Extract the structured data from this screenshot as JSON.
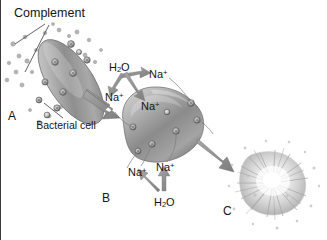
{
  "figure": {
    "background_color": "#ffffff",
    "text_color": "#141414",
    "arrow_color": "#8f8f8f",
    "cell_color": "#9a9a9a"
  },
  "labels": {
    "complement": "Complement",
    "bacterial_cell": "Bacterial cell",
    "panel_a": "A",
    "panel_b": "B",
    "panel_c": "C"
  },
  "ions": {
    "water": "H",
    "water_sub": "2",
    "water_suffix": "O",
    "sodium": "Na",
    "sodium_charge": "+"
  },
  "annotations": [
    {
      "name": "h2o-top",
      "text": "H2O",
      "x": 108,
      "y": 61
    },
    {
      "name": "na-top-right",
      "text": "Na+",
      "x": 148,
      "y": 68
    },
    {
      "name": "na-left",
      "text": "Na+",
      "x": 104,
      "y": 91
    },
    {
      "name": "na-cell",
      "text": "Na+",
      "x": 140,
      "y": 100
    },
    {
      "name": "na-bot-left",
      "text": "Na+",
      "x": 127,
      "y": 166
    },
    {
      "name": "na-bot-right",
      "text": "Na+",
      "x": 155,
      "y": 161
    },
    {
      "name": "h2o-bot",
      "text": "H2O",
      "x": 153,
      "y": 196
    }
  ],
  "panels": [
    {
      "id": "A",
      "caption": "A",
      "description": "Bacterial cell with complement proteins forming membrane pores"
    },
    {
      "id": "B",
      "caption": "B",
      "description": "Swollen cell with sodium and water influx through pores"
    },
    {
      "id": "C",
      "caption": "C",
      "description": "Lysed bacterial cell bursting apart"
    }
  ]
}
